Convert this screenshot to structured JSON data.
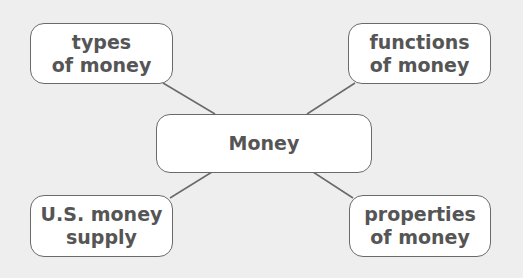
{
  "diagram": {
    "center": {
      "label": "Money"
    },
    "branches": [
      {
        "position": "top-left",
        "lines": [
          "types",
          "of money"
        ]
      },
      {
        "position": "top-right",
        "lines": [
          "functions",
          "of money"
        ]
      },
      {
        "position": "bottom-left",
        "lines": [
          "U.S. money",
          "supply"
        ]
      },
      {
        "position": "bottom-right",
        "lines": [
          "properties",
          "of money"
        ]
      }
    ]
  },
  "colors": {
    "background": "#eeeeee",
    "box_fill": "#ffffff",
    "box_border": "#6a6a6a",
    "text": "#555555",
    "connector": "#6a6a6a"
  }
}
